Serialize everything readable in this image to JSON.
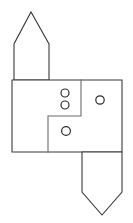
{
  "drawing": {
    "title": "Technical Line Drawing",
    "canvas": {
      "width": 133,
      "height": 223,
      "background": "#ffffff"
    },
    "stroke_colors": {
      "outline": "#3a3a3a",
      "partition": "#6b6b6b",
      "circle": "#2e2e2e"
    },
    "shapes": {
      "top_gable": {
        "name": "upward-pentagon",
        "description": "House/gable shape pointing up attached to top-left of main body",
        "points": "14,80 14,44 31,12 49,44 49,80",
        "apex": {
          "x": 31,
          "y": 12
        },
        "left": 14,
        "right": 49,
        "shoulder_y": 44,
        "base_y": 80
      },
      "main_body": {
        "name": "main-rectangle",
        "description": "Large rectangle forming the central body",
        "points": "12,80 122,80 122,152 12,152",
        "left": 12,
        "top": 80,
        "right": 122,
        "bottom": 152
      },
      "inner_partition": {
        "name": "stepped-partition",
        "description": "L-shaped stepped interior wall line",
        "points": "81,80 81,116 48,116 48,152",
        "vertical_upper_x": 81,
        "step_y": 116,
        "vertical_lower_x": 48
      },
      "bottom_point": {
        "name": "downward-pentagon",
        "description": "Pentagon pointing down attached to bottom-right of main body",
        "points": "82,152 82,192 102,215 122,192 122,152",
        "apex": {
          "x": 102,
          "y": 215
        },
        "left": 82,
        "right": 122,
        "shoulder_y": 192,
        "top_y": 152
      }
    },
    "circles": [
      {
        "name": "marker-circle-1",
        "cx": 65,
        "cy": 93,
        "r": 4.0
      },
      {
        "name": "marker-circle-2",
        "cx": 65,
        "cy": 105,
        "r": 4.0
      },
      {
        "name": "marker-circle-3",
        "cx": 100,
        "cy": 100,
        "r": 4.2
      },
      {
        "name": "marker-circle-4",
        "cx": 66,
        "cy": 131,
        "r": 4.4
      }
    ]
  }
}
